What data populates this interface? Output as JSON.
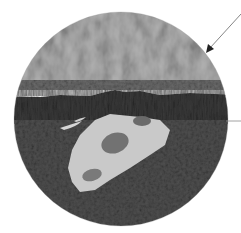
{
  "diagram": {
    "type": "cross-section illustration",
    "circle": {
      "cx": 121,
      "cy": 119,
      "r": 107
    },
    "layers": [
      {
        "name": "top-layer",
        "description": "textured light gray surface layer",
        "color": "#8a8a8a",
        "y_top": 12,
        "y_bottom": 80
      },
      {
        "name": "middle-band",
        "description": "medium-dark gray band",
        "color": "#5a5a5a",
        "y_top": 80,
        "y_bottom": 95
      },
      {
        "name": "dark-layer",
        "description": "very dark striated layer",
        "color": "#2a2a2a",
        "y_top": 95,
        "y_bottom": 122
      },
      {
        "name": "bottom-layer",
        "description": "dark gray lower sediment",
        "color": "#3c3c3c",
        "y_top": 122,
        "y_bottom": 226
      }
    ],
    "fossil": {
      "description": "pale fossil skull embedded in lower layer",
      "color": "#c8c8c8",
      "cavity_color": "#6e6e6e"
    },
    "pointers": [
      {
        "name": "top-layer-arrow",
        "type": "arrow",
        "x1": 241,
        "y1": 14,
        "x2": 207,
        "y2": 52,
        "color": "#555555"
      },
      {
        "name": "boundary-line",
        "type": "line",
        "x1": 226,
        "y1": 121,
        "x2": 241,
        "y2": 121,
        "color": "#888888"
      }
    ],
    "labels": []
  }
}
